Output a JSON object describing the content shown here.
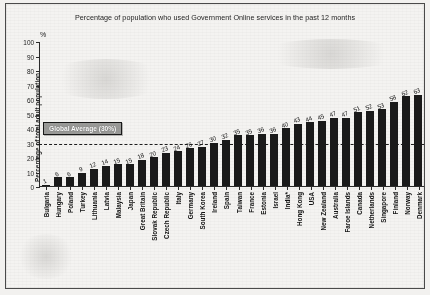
{
  "chart_data": {
    "type": "bar",
    "title": "Percentage of population who used Government Online services in the past 12 months",
    "xlabel": "",
    "ylabel": "Percentage of total adult population",
    "unit_label": "%",
    "ylim": [
      0,
      100
    ],
    "yticks": [
      0,
      10,
      20,
      30,
      40,
      50,
      60,
      70,
      80,
      90,
      100
    ],
    "grid": false,
    "legend": "none",
    "categories": [
      "Bulgaria",
      "Hungary",
      "Poland",
      "Turkey",
      "Lithuania",
      "Latvia",
      "Malaysia",
      "Japan",
      "Great Britain",
      "Slovak Republic",
      "Czech Republic",
      "Italy",
      "Germany",
      "South Korea",
      "Ireland",
      "Spain",
      "Taiwan",
      "France",
      "Estonia",
      "Israel",
      "India*",
      "Hong Kong",
      "USA",
      "New Zealand",
      "Australia",
      "Faroe Islands",
      "Canada",
      "Netherlands",
      "Singapore",
      "Finland",
      "Norway",
      "Denmark"
    ],
    "values": [
      1,
      6,
      6,
      9,
      12,
      14,
      15,
      15,
      18,
      20,
      23,
      24,
      26,
      27,
      30,
      32,
      35,
      35,
      36,
      36,
      40,
      43,
      44,
      45,
      47,
      47,
      51,
      52,
      53,
      58,
      62,
      63
    ],
    "annotations": [
      {
        "name": "global-average",
        "label": "Global Average (30%)",
        "value": 30,
        "style": "dashed-horizontal-line-with-callout-box"
      }
    ]
  },
  "colors": {
    "bar": "#1a1a1a",
    "axis": "#2b2b2b",
    "text": "#131313",
    "callout_fill": "#9a9a98",
    "callout_border": "#191919",
    "page_background": "#f4f3f1",
    "frame_border": "#4a4a4a"
  }
}
